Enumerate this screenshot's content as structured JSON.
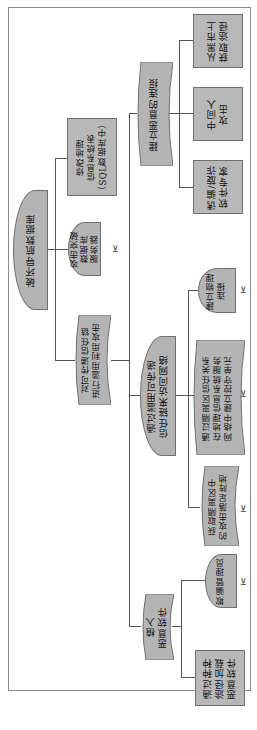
{
  "diagram": {
    "type": "attack-tree",
    "orientation": "rotated-90-ccw",
    "root": {
      "label": "破坏导航数据库"
    },
    "nodes": {
      "attack_db_server": {
        "label": "攻击突破\n数据库\n服务器"
      },
      "modify_gis_table": {
        "label": "修改地理\n信息系统表\n（SQL数据库中）"
      },
      "abuse_trust_chain": {
        "label": "对可传递信任链\n进行滥用利用攻击"
      },
      "malicious_connection": {
        "label": "建立恶意的连接"
      },
      "black_market": {
        "label": "从黑市上\n获取途径"
      },
      "mitm": {
        "label": "中间人\n攻击"
      },
      "lure_expert": {
        "label": "诱骗/旋诈\n软件专家"
      },
      "access_network": {
        "label": "通过滥用可传递\n信任链来访问网络"
      },
      "physical_connection": {
        "label": "建立物理\n连接"
      },
      "dmz_trust": {
        "label": "通过隔离区信任关系\n在地理信息系统服务\n网络中建立控守单元"
      },
      "dmz_foothold": {
        "label": "获取隔离区中\n的攻击落足阵地"
      },
      "implant_malware": {
        "label": "植入\n恶意软件"
      },
      "deceive_admin": {
        "label": "欺骗管理员"
      },
      "load_malware": {
        "label": "通过种种\n途径加载\n恶意软件"
      }
    },
    "leaf_marker": "⊻",
    "colors": {
      "node_fill": "#b4b4b4",
      "node_border": "#6f6f6f",
      "line": "#555555",
      "frame": "#8a8a8a"
    }
  }
}
